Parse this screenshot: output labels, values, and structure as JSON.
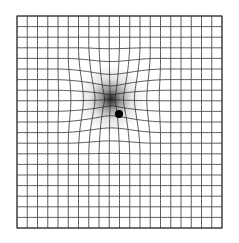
{
  "figure": {
    "name": "amsler-grid-with-metamorphopsia",
    "title": "Amsler Grid",
    "background_color": "#ffffff",
    "canvas": {
      "width": 239,
      "height": 243
    }
  },
  "grid": {
    "name": "amsler-grid",
    "columns": 20,
    "rows": 20,
    "x0": 17,
    "y0": 16,
    "x1": 222,
    "y1": 228,
    "cell_width": 10.25,
    "cell_height": 10.6,
    "line_color": "#4a4a4a",
    "line_width": 0.9,
    "border_color": "#3a3a3a",
    "border_width": 1.1,
    "sample_steps": 60
  },
  "distortion": {
    "name": "pinch-distortion",
    "center_x": 111,
    "center_y": 99,
    "radius": 62,
    "strength": 0.72,
    "type": "radial-pinch"
  },
  "scotoma": {
    "name": "central-scotoma-smudge",
    "center_x": 111,
    "center_y": 99,
    "radius": 34,
    "color": "#1a1a1a",
    "inner_opacity": 0.95,
    "mid_stop": 0.28,
    "outer_stop": 1.0
  },
  "fixation_dot": {
    "name": "fixation-dot",
    "center_x": 119,
    "center_y": 114,
    "radius": 4.1,
    "color": "#000000"
  },
  "colors": {
    "background": "#ffffff",
    "grid_line": "#4a4a4a",
    "dot": "#000000",
    "smudge": "#1a1a1a"
  }
}
